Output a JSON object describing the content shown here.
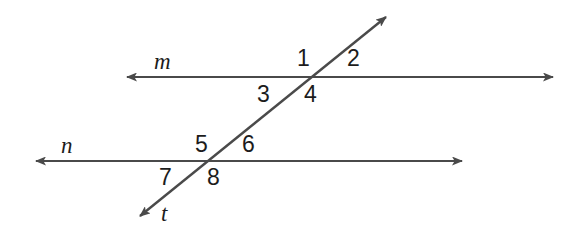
{
  "figure": {
    "background_color": "#ffffff",
    "stroke_color": "#4a4a4a",
    "text_color": "#1c1c1c"
  },
  "lines": [
    {
      "id": "line-m",
      "label": "m",
      "kind": "parallel-line",
      "label_x": 154,
      "label_y": 50,
      "x1": 127,
      "y1": 77,
      "x2": 553,
      "y2": 77,
      "arrow_start": true,
      "arrow_end": true
    },
    {
      "id": "line-n",
      "label": "n",
      "kind": "parallel-line",
      "label_x": 61,
      "label_y": 134,
      "x1": 36,
      "y1": 161,
      "x2": 462,
      "y2": 161,
      "arrow_start": true,
      "arrow_end": true
    },
    {
      "id": "line-t",
      "label": "t",
      "kind": "transversal",
      "label_x": 161,
      "label_y": 202,
      "x1": 140,
      "y1": 216,
      "x2": 386,
      "y2": 17,
      "arrow_start": true,
      "arrow_end": true
    }
  ],
  "intersections": [
    {
      "id": "intersection-m-t",
      "x": 315,
      "y": 77
    },
    {
      "id": "intersection-n-t",
      "x": 209,
      "y": 161
    }
  ],
  "angle_labels": [
    {
      "id": "angle-1",
      "text": "1",
      "x": 297,
      "y": 47,
      "at": "intersection-m-t",
      "position": "upper-left"
    },
    {
      "id": "angle-2",
      "text": "2",
      "x": 347,
      "y": 47,
      "at": "intersection-m-t",
      "position": "upper-right"
    },
    {
      "id": "angle-3",
      "text": "3",
      "x": 257,
      "y": 83,
      "at": "intersection-m-t",
      "position": "lower-left"
    },
    {
      "id": "angle-4",
      "text": "4",
      "x": 304,
      "y": 83,
      "at": "intersection-m-t",
      "position": "lower-right"
    },
    {
      "id": "angle-5",
      "text": "5",
      "x": 195,
      "y": 133,
      "at": "intersection-n-t",
      "position": "upper-left"
    },
    {
      "id": "angle-6",
      "text": "6",
      "x": 242,
      "y": 133,
      "at": "intersection-n-t",
      "position": "upper-right"
    },
    {
      "id": "angle-7",
      "text": "7",
      "x": 159,
      "y": 166,
      "at": "intersection-n-t",
      "position": "lower-left"
    },
    {
      "id": "angle-8",
      "text": "8",
      "x": 207,
      "y": 166,
      "at": "intersection-n-t",
      "position": "lower-right"
    }
  ]
}
